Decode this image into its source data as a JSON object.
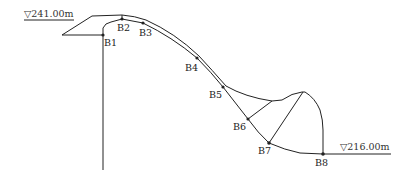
{
  "diagram": {
    "type": "slope-cross-section",
    "elevations": {
      "top": "▽241.00m",
      "bottom": "▽216.00m"
    },
    "points": [
      {
        "id": "B1",
        "label": "B1",
        "x": 103,
        "y": 35
      },
      {
        "id": "B2",
        "label": "B2",
        "x": 122,
        "y": 19
      },
      {
        "id": "B3",
        "label": "B3",
        "x": 143,
        "y": 23
      },
      {
        "id": "B4",
        "label": "B4",
        "x": 197,
        "y": 58
      },
      {
        "id": "B5",
        "label": "B5",
        "x": 223,
        "y": 87
      },
      {
        "id": "B6",
        "label": "B6",
        "x": 248,
        "y": 119
      },
      {
        "id": "B7",
        "label": "B7",
        "x": 269,
        "y": 143
      },
      {
        "id": "B8",
        "label": "B8",
        "x": 323,
        "y": 154
      }
    ],
    "colors": {
      "line": "#222222",
      "background": "#ffffff"
    }
  }
}
